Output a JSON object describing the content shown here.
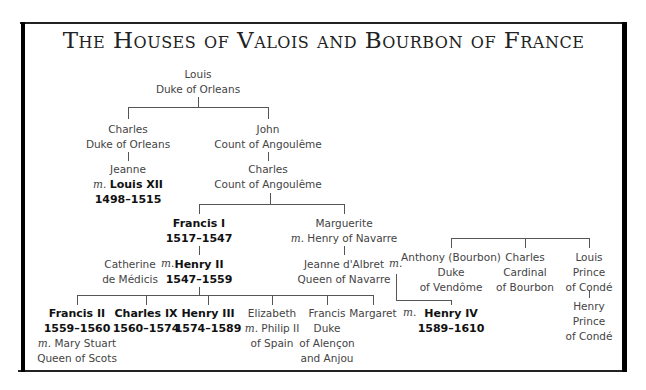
{
  "title": "The Houses of Valois and Bourbon of France",
  "marriage_marker": "m.",
  "nodes": {
    "louis_orleans": {
      "name": "Louis",
      "title": "Duke of Orleans"
    },
    "charles_orleans": {
      "name": "Charles",
      "title": "Duke of Orleans"
    },
    "john_angouleme": {
      "name": "John",
      "title": "Count of Angoulême"
    },
    "jeanne": {
      "name": "Jeanne",
      "spouse": "Louis XII",
      "reign": "1498–1515"
    },
    "charles_angouleme": {
      "name": "Charles",
      "title": "Count of Angoulême"
    },
    "francis_i": {
      "name": "Francis I",
      "reign": "1517–1547"
    },
    "marguerite": {
      "name": "Marguerite",
      "spouse": "Henry of Navarre"
    },
    "catherine": {
      "name_line1": "Catherine",
      "name_line2": "de Médicis"
    },
    "henry_ii": {
      "name": "Henry II",
      "reign": "1547–1559"
    },
    "jeanne_albret": {
      "name": "Jeanne d'Albret",
      "title": "Queen of Navarre"
    },
    "anthony": {
      "name": "Anthony (Bourbon)",
      "title_line1": "Duke",
      "title_line2": "of Vendôme"
    },
    "charles_bourbon": {
      "name": "Charles",
      "title_line1": "Cardinal",
      "title_line2": "of Bourbon"
    },
    "louis_conde": {
      "name": "Louis",
      "title_line1": "Prince",
      "title_line2": "of Condé"
    },
    "henry_conde": {
      "name": "Henry",
      "title_line1": "Prince",
      "title_line2": "of Condé"
    },
    "francis_ii": {
      "name": "Francis II",
      "reign": "1559–1560",
      "spouse": "Mary Stuart",
      "spouse_title": "Queen of Scots"
    },
    "charles_ix": {
      "name": "Charles IX",
      "reign": "1560–1574"
    },
    "henry_iii": {
      "name": "Henry III",
      "reign": "1574–1589"
    },
    "elizabeth": {
      "name": "Elizabeth",
      "spouse": "Philip II",
      "spouse_title": "of Spain"
    },
    "francis_alencon": {
      "name": "Francis",
      "title_line1": "Duke",
      "title_line2": "of Alençon",
      "title_line3": "and Anjou"
    },
    "margaret": {
      "name": "Margaret"
    },
    "henry_iv": {
      "name": "Henry IV",
      "reign": "1589–1610"
    }
  }
}
